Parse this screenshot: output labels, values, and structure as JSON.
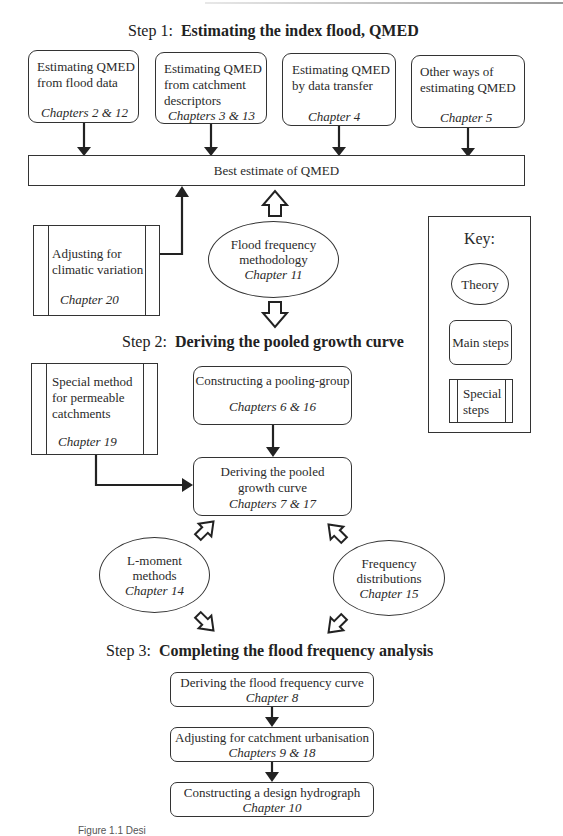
{
  "step1": {
    "prefix": "Step 1:",
    "title": "Estimating the index flood, QMED",
    "boxes": [
      {
        "line1": "Estimating QMED",
        "line2": "from flood data",
        "line3": "",
        "chapter": "Chapters 2 & 12"
      },
      {
        "line1": "Estimating QMED",
        "line2": "from catchment",
        "line3": "descriptors",
        "chapter": "Chapters 3 & 13"
      },
      {
        "line1": "Estimating QMED",
        "line2": "by data transfer",
        "line3": "",
        "chapter": "Chapter 4"
      },
      {
        "line1": "Other ways of",
        "line2": "estimating QMED",
        "line3": "",
        "chapter": "Chapter 5"
      }
    ],
    "best_estimate": "Best estimate of QMED",
    "climatic": {
      "line1": "Adjusting for",
      "line2": "climatic variation",
      "chapter": "Chapter 20"
    },
    "theory": {
      "line1": "Flood frequency",
      "line2": "methodology",
      "chapter": "Chapter 11"
    }
  },
  "key": {
    "title": "Key:",
    "theory": "Theory",
    "main_steps": "Main steps",
    "special_line1": "Special",
    "special_line2": "steps"
  },
  "step2": {
    "prefix": "Step 2:",
    "title": "Deriving the pooled growth curve",
    "permeable": {
      "line1": "Special method",
      "line2": "for permeable",
      "line3": "catchments",
      "chapter": "Chapter 19"
    },
    "pooling": {
      "line1": "Constructing a pooling-group",
      "chapter": "Chapters 6 & 16"
    },
    "growth": {
      "line1": "Deriving the pooled",
      "line2": "growth curve",
      "chapter": "Chapters 7 & 17"
    },
    "lmoment": {
      "line1": "L-moment",
      "line2": "methods",
      "chapter": "Chapter 14"
    },
    "freqdist": {
      "line1": "Frequency",
      "line2": "distributions",
      "chapter": "Chapter 15"
    }
  },
  "step3": {
    "prefix": "Step 3:",
    "title": "Completing the flood frequency analysis",
    "boxes": [
      {
        "line1": "Deriving the flood frequency curve",
        "chapter": "Chapter 8"
      },
      {
        "line1": "Adjusting for catchment urbanisation",
        "chapter": "Chapters 9 & 18"
      },
      {
        "line1": "Constructing a design hydrograph",
        "chapter": "Chapter 10"
      }
    ]
  },
  "caption": "Figure 1.1 Desi"
}
